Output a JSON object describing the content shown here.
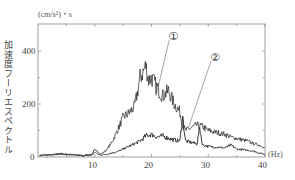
{
  "chart_data": {
    "type": "line",
    "title": "",
    "ylabel": "加速度フーリエスペクトル",
    "yunit": "(cm/s²)・s",
    "xlabel": "",
    "xunit": "(Hz)",
    "xlim": [
      0,
      40
    ],
    "ylim": [
      0,
      500
    ],
    "xticks": [
      10,
      20,
      30,
      40
    ],
    "yticks": [
      0,
      200,
      400
    ],
    "grid": false,
    "legend": "callout labels ① and ② with leader lines",
    "series": [
      {
        "name": "①",
        "x": [
          0,
          2,
          4,
          6,
          8,
          9.5,
          10,
          11,
          12,
          13,
          14,
          15,
          16,
          17,
          17.5,
          18,
          18.5,
          19,
          19.5,
          20,
          21,
          22,
          23,
          24,
          25,
          25.5,
          26,
          27,
          28,
          29,
          30,
          31,
          32,
          33,
          34,
          35,
          36,
          37,
          38,
          39,
          40
        ],
        "y": [
          5,
          8,
          12,
          8,
          5,
          8,
          15,
          10,
          25,
          55,
          100,
          150,
          165,
          190,
          240,
          300,
          320,
          345,
          290,
          300,
          260,
          230,
          250,
          200,
          170,
          120,
          100,
          110,
          120,
          115,
          100,
          95,
          90,
          85,
          75,
          70,
          65,
          60,
          50,
          45,
          35
        ]
      },
      {
        "name": "②",
        "x": [
          0,
          2,
          4,
          6,
          8,
          9.5,
          10,
          11,
          12,
          13,
          14,
          15,
          16,
          17,
          18,
          19,
          20,
          21,
          22,
          23,
          24,
          25,
          25.5,
          26,
          27,
          28,
          28.5,
          29,
          30,
          31,
          32,
          33,
          34,
          35,
          36,
          37,
          38,
          39,
          40
        ],
        "y": [
          5,
          8,
          12,
          8,
          5,
          10,
          30,
          8,
          10,
          15,
          20,
          30,
          40,
          50,
          60,
          80,
          85,
          75,
          80,
          70,
          65,
          60,
          150,
          60,
          55,
          50,
          110,
          45,
          40,
          38,
          36,
          35,
          45,
          30,
          28,
          25,
          22,
          15,
          10
        ]
      }
    ],
    "annotations": [
      {
        "text": "①",
        "x": 23.5,
        "y": 460
      },
      {
        "text": "②",
        "x": 31,
        "y": 380
      }
    ]
  },
  "labels": {
    "unit": "(cm/s²)・s",
    "ylabel": "加速度フーリエスペクトル",
    "hz": "(Hz)",
    "x0": "0",
    "x10": "10",
    "x20": "20",
    "x30": "30",
    "x40": "40",
    "y0": "0",
    "y200": "200",
    "y400": "400",
    "mark1": "①",
    "mark2": "②"
  }
}
